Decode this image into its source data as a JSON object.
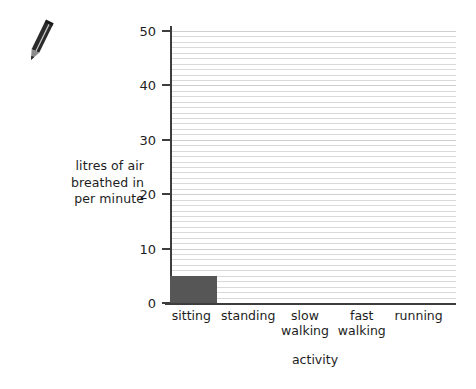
{
  "decorations": {
    "pencil": {
      "icon": "pencil-icon",
      "body_color": "#2b2b2b",
      "tip_color": "#8c8c8c"
    }
  },
  "chart_data": {
    "type": "bar",
    "title": "",
    "xlabel": "activity",
    "ylabel": "litres of air breathed in per minute",
    "ylabel_lines": [
      "litres of air",
      "breathed in",
      "per minute"
    ],
    "categories": [
      "sitting",
      "standing",
      "slow walking",
      "fast walking",
      "running"
    ],
    "category_lines": [
      [
        "sitting"
      ],
      [
        "standing"
      ],
      [
        "slow",
        "walking"
      ],
      [
        "fast",
        "walking"
      ],
      [
        "running"
      ]
    ],
    "values": [
      5,
      null,
      null,
      null,
      null
    ],
    "ylim": [
      0,
      50
    ],
    "ytick_labels": [
      "0",
      "10",
      "20",
      "30",
      "40",
      "50"
    ],
    "ytick_values": [
      0,
      10,
      20,
      30,
      40,
      50
    ],
    "minor_tick_interval": 1,
    "grid": true,
    "grid_orientation": "horizontal",
    "legend": false,
    "bar_color": "#565656",
    "gridline_color": "#d9d9d9",
    "axis_color": "#3d3d3d"
  }
}
